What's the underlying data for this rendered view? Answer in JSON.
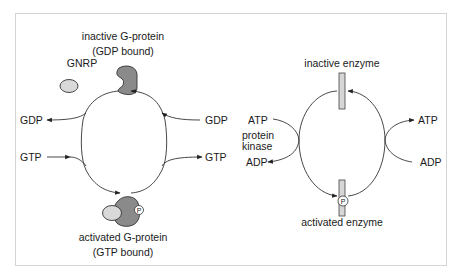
{
  "left_panel": {
    "inactive_label_line1": "inactive G-protein",
    "inactive_label_line2": "(GDP bound)",
    "gnrp_label": "GNRP",
    "gdp_out_label": "GDP",
    "gdp_in_label": "GDP",
    "gtp_in_label": "GTP",
    "gtp_out_label": "GTP",
    "phosphate_label": "P",
    "activated_label_line1": "activated G-protein",
    "activated_label_line2": "(GTP bound)"
  },
  "right_panel": {
    "inactive_label": "inactive enzyme",
    "atp_in_label": "ATP",
    "kinase_label_line1": "protein",
    "kinase_label_line2": "kinase",
    "adp_out_label": "ADP",
    "atp_out_label": "ATP",
    "adp_in_label": "ADP",
    "phosphate_label": "P",
    "activated_label": "activated enzyme"
  },
  "colors": {
    "protein_dark": "#8a8a8a",
    "protein_light": "#d9d9d9",
    "enzyme_bar": "#d6d6d6",
    "line": "#333333",
    "frame": "#d4d4d4"
  }
}
